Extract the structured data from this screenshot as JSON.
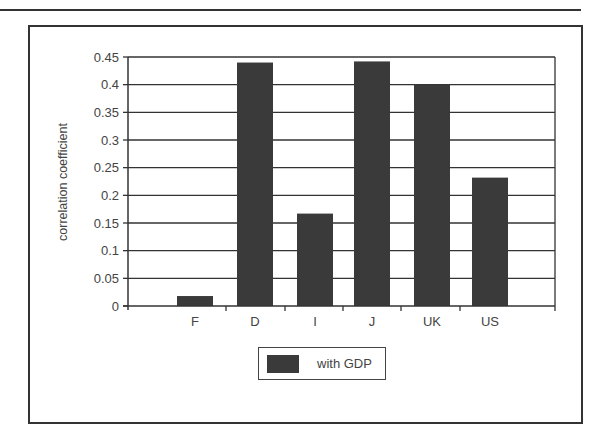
{
  "chart_data": {
    "type": "bar",
    "title": "",
    "xlabel": "",
    "ylabel": "correlation coefficient",
    "categories": [
      "F",
      "D",
      "I",
      "J",
      "UK",
      "US"
    ],
    "series": [
      {
        "name": "with GDP",
        "values": [
          0.018,
          0.44,
          0.167,
          0.442,
          0.4,
          0.232
        ],
        "color": "#3a3a3a"
      }
    ],
    "ylim": [
      0,
      0.45
    ],
    "yticks": [
      "0",
      "0.05",
      "0.1",
      "0.15",
      "0.2",
      "0.25",
      "0.3",
      "0.35",
      "0.4",
      "0.45"
    ],
    "grid": true,
    "legend_position": "bottom"
  },
  "legend": {
    "label": "with GDP"
  }
}
